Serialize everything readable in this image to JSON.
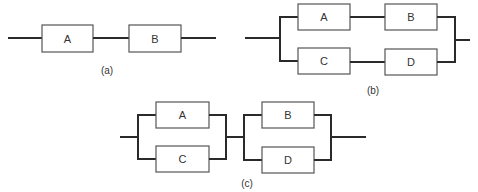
{
  "diagrams": {
    "a": {
      "caption": "(a)",
      "type": "series",
      "blocks": [
        {
          "label": "A"
        },
        {
          "label": "B"
        }
      ]
    },
    "b": {
      "caption": "(b)",
      "type": "parallel of series paths",
      "blocks": [
        {
          "label": "A"
        },
        {
          "label": "B"
        },
        {
          "label": "C"
        },
        {
          "label": "D"
        }
      ]
    },
    "c": {
      "caption": "(c)",
      "type": "series of parallel pairs",
      "blocks": [
        {
          "label": "A"
        },
        {
          "label": "C"
        },
        {
          "label": "B"
        },
        {
          "label": "D"
        }
      ]
    }
  }
}
